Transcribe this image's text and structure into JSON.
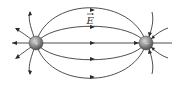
{
  "diagram": {
    "type": "electric-dipole-field-lines",
    "field_label": "E",
    "field_label_vector": true,
    "charges": [
      {
        "name": "positive-charge",
        "sign": "+",
        "x": 36,
        "y": 43,
        "r": 7
      },
      {
        "name": "negative-charge",
        "sign": "−",
        "x": 146,
        "y": 43,
        "r": 7
      }
    ],
    "colors": {
      "line": "#3a3a3a",
      "charge_fill": "#8a8a8a",
      "background": "#ffffff"
    }
  }
}
